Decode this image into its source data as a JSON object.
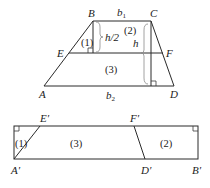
{
  "colors": {
    "fill": "#c8c8c8",
    "stroke": "#2a2a2a",
    "background": "#ffffff"
  },
  "trapezoid": {
    "vertices": {
      "A": "A",
      "B": "B",
      "C": "C",
      "D": "D",
      "E": "E",
      "F": "F"
    },
    "labels": {
      "b1": "b",
      "b1_sub": "1",
      "b2": "b",
      "b2_sub": "2",
      "half_height": "h/2",
      "height": "h"
    },
    "regions": {
      "r1": "(1)",
      "r2": "(2)",
      "r3": "(3)"
    }
  },
  "rectangle": {
    "vertices": {
      "A_prime": "A′",
      "E_prime": "E′",
      "F_prime": "F′",
      "D_prime": "D′",
      "B_prime": "B′"
    },
    "regions": {
      "r1": "(1)",
      "r3": "(3)",
      "r2": "(2)"
    }
  }
}
